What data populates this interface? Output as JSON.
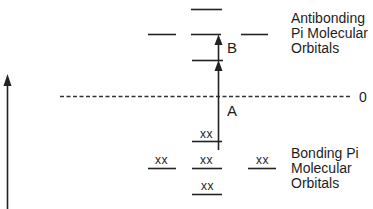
{
  "diagram": {
    "antibonding_label": [
      "Antibonding",
      "Pi Molecular",
      "Orbitals"
    ],
    "bonding_label": [
      "Bonding Pi",
      "Molecular",
      "Orbitals"
    ],
    "zero_label": "0",
    "transition_labels": {
      "A": "A",
      "B": "B"
    },
    "electron_pair": "xx",
    "levels": {
      "antibonding": [
        {
          "id": "ab-top",
          "occupied": false
        },
        {
          "id": "ab-mid-left",
          "occupied": false
        },
        {
          "id": "ab-mid-center",
          "occupied": false
        },
        {
          "id": "ab-mid-right",
          "occupied": false
        },
        {
          "id": "ab-lowest",
          "occupied": false
        }
      ],
      "bonding": [
        {
          "id": "b-highest",
          "occupied": true
        },
        {
          "id": "b-mid-left",
          "occupied": true
        },
        {
          "id": "b-mid-center",
          "occupied": true
        },
        {
          "id": "b-mid-right",
          "occupied": true
        },
        {
          "id": "b-bottom",
          "occupied": true
        }
      ]
    },
    "transitions": [
      {
        "label": "A",
        "from": "b-highest",
        "to": "ab-lowest"
      },
      {
        "label": "B",
        "from": "ab-lowest",
        "to": "ab-mid-center"
      }
    ],
    "energy_axis": "increasing upward"
  }
}
